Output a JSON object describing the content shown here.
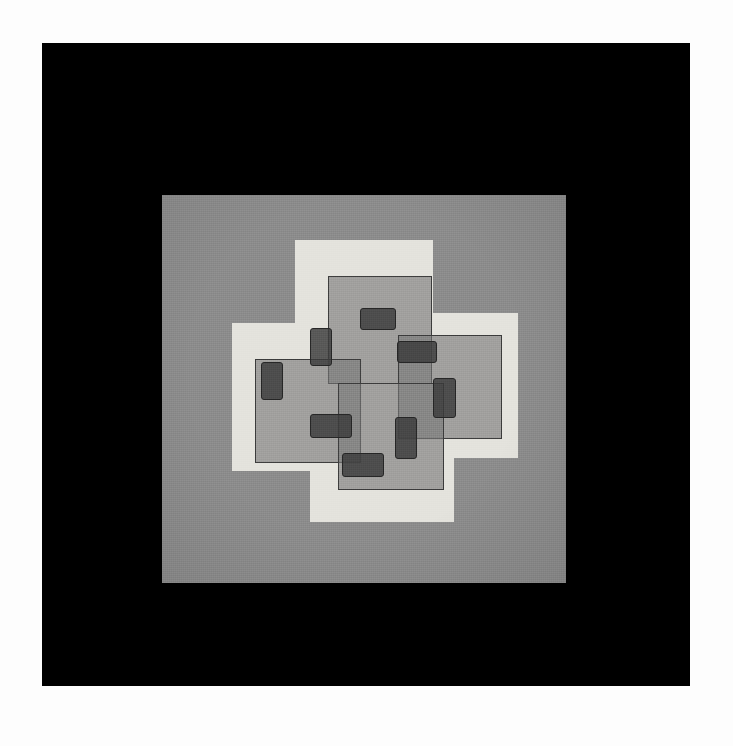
{
  "artwork": {
    "title": "Geometric Pinwheel Composition",
    "medium_note": "abstract hard-edge painting on gray board in black mount",
    "canvas": {
      "width": 733,
      "height": 746,
      "background": "#fdfdfd"
    }
  },
  "palette": {
    "paper_white": "#fdfdfd",
    "frame_black": "#000000",
    "field_gray": "#8c8c8c",
    "light_square": "#e4e3dd",
    "translucent_gray": "rgba(120,120,120,0.62)",
    "dark_rect": "rgba(58,58,58,0.82)",
    "outline": "#3c3c3c"
  },
  "frame": {
    "x": 42,
    "y": 43,
    "width": 648,
    "height": 643,
    "color": "#000000"
  },
  "field": {
    "x": 162,
    "y": 195,
    "width": 404,
    "height": 388,
    "color": "#8c8c8c"
  },
  "chart_data": {
    "type": "scatter",
    "title": "Geometric Pinwheel Composition",
    "xlabel": "",
    "ylabel": "",
    "xlim": [
      0,
      404
    ],
    "ylim": [
      0,
      388
    ],
    "grid": false,
    "legend": "none",
    "annotations": [
      "Four cream squares in pinwheel rotation",
      "Four translucent gray squares outlined in dark line",
      "Eight small dark rectangles with rounded corners"
    ],
    "series": [
      {
        "name": "light-squares",
        "fill": "#e4e3dd",
        "shapes": [
          {
            "id": "light-top",
            "x": 133,
            "y": 45,
            "w": 138,
            "h": 150
          },
          {
            "id": "light-right",
            "x": 208,
            "y": 118,
            "w": 148,
            "h": 145
          },
          {
            "id": "light-left",
            "x": 70,
            "y": 128,
            "w": 148,
            "h": 148
          },
          {
            "id": "light-bottom",
            "x": 148,
            "y": 195,
            "w": 144,
            "h": 132
          }
        ]
      },
      {
        "name": "translucent-gray-squares",
        "fill": "rgba(120,120,120,0.62)",
        "stroke": "#3c3c3c",
        "shapes": [
          {
            "id": "gray-top",
            "x": 166,
            "y": 81,
            "w": 104,
            "h": 108
          },
          {
            "id": "gray-right",
            "x": 236,
            "y": 140,
            "w": 104,
            "h": 104
          },
          {
            "id": "gray-left",
            "x": 93,
            "y": 164,
            "w": 106,
            "h": 104
          },
          {
            "id": "gray-bottom",
            "x": 176,
            "y": 188,
            "w": 106,
            "h": 107
          }
        ]
      },
      {
        "name": "dark-rectangles",
        "fill": "rgba(58,58,58,0.82)",
        "stroke": "#262626",
        "shapes": [
          {
            "id": "dark-top-wide",
            "x": 198,
            "y": 113,
            "w": 36,
            "h": 22
          },
          {
            "id": "dark-upperleft",
            "x": 148,
            "y": 133,
            "w": 22,
            "h": 38
          },
          {
            "id": "dark-midleft",
            "x": 99,
            "y": 167,
            "w": 22,
            "h": 38
          },
          {
            "id": "dark-rightupper",
            "x": 235,
            "y": 146,
            "w": 40,
            "h": 22
          },
          {
            "id": "dark-rightmid",
            "x": 271,
            "y": 183,
            "w": 23,
            "h": 40
          },
          {
            "id": "dark-lowerleft",
            "x": 148,
            "y": 219,
            "w": 42,
            "h": 24
          },
          {
            "id": "dark-lowermid",
            "x": 233,
            "y": 222,
            "w": 22,
            "h": 42
          },
          {
            "id": "dark-bottom-wide",
            "x": 180,
            "y": 258,
            "w": 42,
            "h": 24
          }
        ]
      }
    ]
  }
}
